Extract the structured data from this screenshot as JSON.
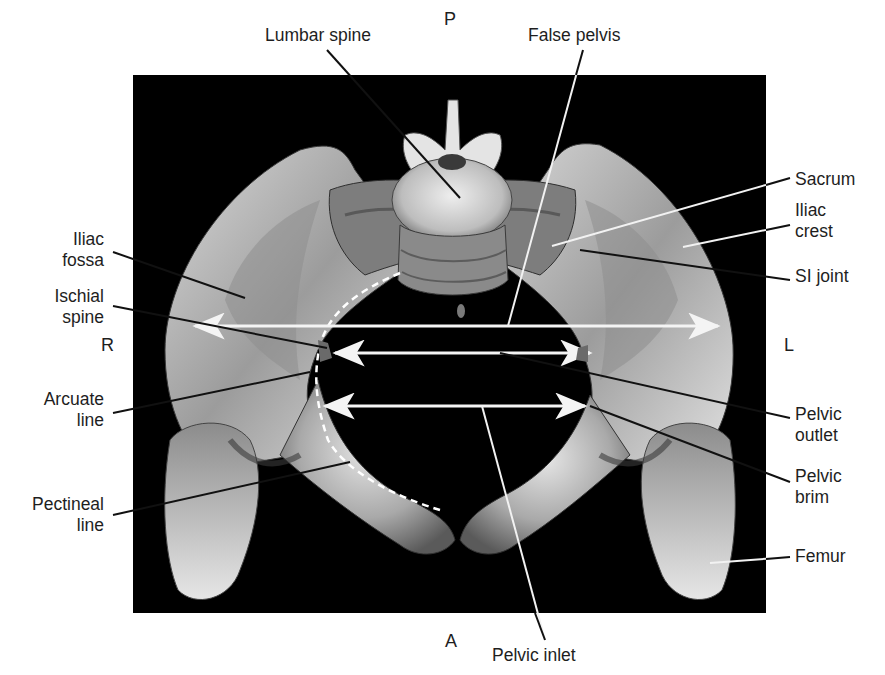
{
  "figure": {
    "background_color": "#ffffff",
    "panel_color": "#000000",
    "bone_color": "#c8c8c8",
    "annotation_color": "#f2f2f2",
    "leader_dark_color": "#111111"
  },
  "orientation": {
    "posterior": "P",
    "anterior": "A",
    "right": "R",
    "left": "L"
  },
  "labels": {
    "lumbar_spine": "Lumbar spine",
    "false_pelvis": "False pelvis",
    "sacrum": "Sacrum",
    "iliac_crest": "Iliac\ncrest",
    "si_joint": "SI joint",
    "iliac_fossa": "Iliac\nfossa",
    "ischial_spine": "Ischial\nspine",
    "arcuate_line": "Arcuate\nline",
    "pectineal_line": "Pectineal\nline",
    "pelvic_outlet": "Pelvic\noutlet",
    "pelvic_brim": "Pelvic\nbrim",
    "femur": "Femur",
    "pelvic_inlet": "Pelvic inlet"
  },
  "measurements": [
    {
      "name": "false-pelvis-width",
      "label_ref": "false_pelvis"
    },
    {
      "name": "pelvic-outlet-width",
      "label_ref": "pelvic_outlet"
    },
    {
      "name": "pelvic-inlet-width",
      "label_ref": "pelvic_inlet"
    }
  ]
}
